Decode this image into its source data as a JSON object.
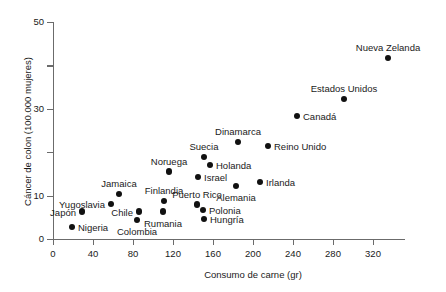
{
  "chart_data": {
    "type": "scatter",
    "title": "",
    "xlabel": "Consumo de carne (gr)",
    "ylabel": "Cáncer de colon (100.000 mujeres)",
    "xlim": [
      0,
      352
    ],
    "ylim": [
      0,
      50
    ],
    "grid": false,
    "legend": "none",
    "xticks": [
      {
        "value": 0,
        "label": "0"
      },
      {
        "value": 40,
        "label": "40"
      },
      {
        "value": 80,
        "label": "80"
      },
      {
        "value": 120,
        "label": "120"
      },
      {
        "value": 160,
        "label": "160"
      },
      {
        "value": 200,
        "label": "200"
      },
      {
        "value": 240,
        "label": "240"
      },
      {
        "value": 280,
        "label": "280"
      },
      {
        "value": 320,
        "label": "320"
      }
    ],
    "yticks": [
      {
        "value": 0,
        "label": "0"
      },
      {
        "value": 10,
        "label": "10"
      },
      {
        "value": 20,
        "label": ""
      },
      {
        "value": 30,
        "label": "30"
      },
      {
        "value": 40,
        "label": ""
      },
      {
        "value": 50,
        "label": "50"
      }
    ],
    "points": [
      {
        "name": "Nigeria",
        "x": 19,
        "y": 2.8,
        "label_pos": "right"
      },
      {
        "name": "Japón",
        "x": 29,
        "y": 6.3,
        "label_pos": "left"
      },
      {
        "name": "Yugoslavia",
        "x": 58,
        "y": 8.1,
        "label_pos": "left"
      },
      {
        "name": "Jamaica",
        "x": 66,
        "y": 10.4,
        "label_pos": "above"
      },
      {
        "name": "Chile",
        "x": 86,
        "y": 6.3,
        "label_pos": "left"
      },
      {
        "name": "Colombia",
        "x": 84,
        "y": 4.4,
        "label_pos": "below"
      },
      {
        "name": "Finlandia",
        "x": 111,
        "y": 8.8,
        "label_pos": "above"
      },
      {
        "name": "Rumania",
        "x": 110,
        "y": 6.3,
        "label_pos": "below"
      },
      {
        "name": "Noruega",
        "x": 116,
        "y": 15.5,
        "label_pos": "above"
      },
      {
        "name": "Puerto Rico",
        "x": 144,
        "y": 7.9,
        "label_pos": "above"
      },
      {
        "name": "Polonia",
        "x": 150,
        "y": 6.7,
        "label_pos": "right"
      },
      {
        "name": "Hungría",
        "x": 151,
        "y": 4.6,
        "label_pos": "right"
      },
      {
        "name": "Israel",
        "x": 145,
        "y": 14.3,
        "label_pos": "right"
      },
      {
        "name": "Suecia",
        "x": 151,
        "y": 18.9,
        "label_pos": "above"
      },
      {
        "name": "Holanda",
        "x": 157,
        "y": 17.1,
        "label_pos": "right"
      },
      {
        "name": "Alemania",
        "x": 183,
        "y": 12.2,
        "label_pos": "below"
      },
      {
        "name": "Dinamarca",
        "x": 185,
        "y": 22.4,
        "label_pos": "above"
      },
      {
        "name": "Irlanda",
        "x": 207,
        "y": 13.1,
        "label_pos": "right"
      },
      {
        "name": "Reino Unido",
        "x": 215,
        "y": 21.4,
        "label_pos": "right"
      },
      {
        "name": "Canadá",
        "x": 244,
        "y": 28.3,
        "label_pos": "right"
      },
      {
        "name": "Estados Unidos",
        "x": 291,
        "y": 32.3,
        "label_pos": "above"
      },
      {
        "name": "Nueva Zelanda",
        "x": 335,
        "y": 41.7,
        "label_pos": "above"
      }
    ]
  }
}
